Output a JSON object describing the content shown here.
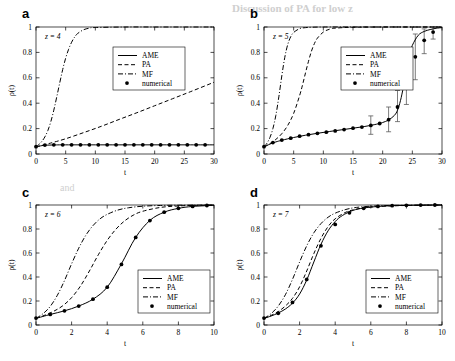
{
  "figure": {
    "background_bleed": [
      {
        "text": "Discussion of PA for low z",
        "x": 232,
        "y": 6
      },
      {
        "text": "and",
        "x": 60,
        "y": 188
      }
    ]
  },
  "common": {
    "xlabel": "t",
    "ylabel": "ρ(t)",
    "ylim": [
      0,
      1
    ],
    "yticks": [
      0,
      0.2,
      0.4,
      0.6,
      0.8,
      1
    ],
    "ytick_labels": [
      "0",
      "0.2",
      "0.4",
      "0.6",
      "0.8",
      "1"
    ],
    "legend_entries": [
      {
        "label": "AME",
        "style": "solid"
      },
      {
        "label": "PA",
        "style": "dashed"
      },
      {
        "label": "MF",
        "style": "dashdot"
      },
      {
        "label": "numerical",
        "style": "marker"
      }
    ],
    "grid": false,
    "legend_position": "inner"
  },
  "chart_data": [
    {
      "type": "line",
      "panel": "a",
      "panel_letter": "a",
      "annotation": "z = 4",
      "title": "",
      "xlabel": "t",
      "ylabel": "ρ(t)",
      "xlim": [
        0,
        30
      ],
      "ylim": [
        0,
        1
      ],
      "xticks": [
        0,
        5,
        10,
        15,
        20,
        25,
        30
      ],
      "xtick_labels": [
        "0",
        "5",
        "10",
        "15",
        "20",
        "25",
        "30"
      ],
      "yticks": [
        0,
        0.2,
        0.4,
        0.6,
        0.8,
        1
      ],
      "series": [
        {
          "name": "AME",
          "style": "solid",
          "x": [
            0,
            1,
            2,
            3,
            4,
            6,
            8,
            10,
            14,
            18,
            22,
            26,
            30
          ],
          "values": [
            0.055,
            0.066,
            0.07,
            0.071,
            0.072,
            0.072,
            0.072,
            0.072,
            0.072,
            0.072,
            0.072,
            0.072,
            0.072
          ]
        },
        {
          "name": "PA",
          "style": "dashed",
          "x": [
            0,
            1,
            2,
            3,
            5,
            8,
            11,
            14,
            17,
            20,
            23,
            26,
            30
          ],
          "values": [
            0.055,
            0.068,
            0.08,
            0.093,
            0.12,
            0.168,
            0.218,
            0.272,
            0.325,
            0.38,
            0.435,
            0.49,
            0.565
          ]
        },
        {
          "name": "MF",
          "style": "dashdot",
          "x": [
            0,
            0.5,
            1,
            1.5,
            2,
            2.5,
            3,
            3.5,
            4,
            4.5,
            5,
            5.5,
            6,
            6.5,
            7,
            8,
            9,
            10,
            15,
            20,
            25,
            30
          ],
          "values": [
            0.055,
            0.075,
            0.1,
            0.135,
            0.185,
            0.255,
            0.345,
            0.45,
            0.56,
            0.665,
            0.755,
            0.825,
            0.88,
            0.92,
            0.948,
            0.978,
            0.991,
            0.996,
            1.0,
            1.0,
            1.0,
            1.0
          ]
        },
        {
          "name": "numerical",
          "style": "marker",
          "x": [
            0,
            1.5,
            3,
            4.5,
            6,
            7.5,
            9,
            10.5,
            12,
            13.5,
            15,
            16.5,
            18,
            19.5,
            21,
            22.5,
            24,
            25.5,
            27,
            28.5
          ],
          "values": [
            0.058,
            0.07,
            0.072,
            0.072,
            0.072,
            0.072,
            0.072,
            0.072,
            0.072,
            0.072,
            0.072,
            0.072,
            0.072,
            0.072,
            0.072,
            0.072,
            0.072,
            0.072,
            0.072,
            0.072
          ]
        }
      ]
    },
    {
      "type": "line",
      "panel": "b",
      "panel_letter": "b",
      "annotation": "z = 5",
      "title": "",
      "xlabel": "t",
      "ylabel": "ρ(t)",
      "xlim": [
        0,
        30
      ],
      "ylim": [
        0,
        1
      ],
      "xticks": [
        0,
        5,
        10,
        15,
        20,
        25,
        30
      ],
      "xtick_labels": [
        "0",
        "5",
        "10",
        "15",
        "20",
        "25",
        "30"
      ],
      "yticks": [
        0,
        0.2,
        0.4,
        0.6,
        0.8,
        1
      ],
      "series": [
        {
          "name": "AME",
          "style": "solid",
          "x": [
            0,
            1,
            2,
            3,
            5,
            7,
            9,
            11,
            13,
            15,
            17,
            19,
            20,
            21,
            22,
            22.5,
            23,
            23.5,
            24,
            24.5,
            25,
            26,
            27,
            28,
            29,
            30
          ],
          "values": [
            0.055,
            0.078,
            0.095,
            0.108,
            0.13,
            0.148,
            0.163,
            0.177,
            0.19,
            0.203,
            0.217,
            0.235,
            0.248,
            0.268,
            0.305,
            0.345,
            0.42,
            0.53,
            0.66,
            0.775,
            0.855,
            0.935,
            0.965,
            0.98,
            0.99,
            0.995
          ]
        },
        {
          "name": "PA",
          "style": "dashed",
          "x": [
            0,
            1,
            2,
            3,
            4,
            5,
            6,
            6.5,
            7,
            7.5,
            8,
            8.5,
            9,
            10,
            11,
            12,
            15,
            20,
            25,
            30
          ],
          "values": [
            0.055,
            0.082,
            0.115,
            0.16,
            0.225,
            0.32,
            0.46,
            0.545,
            0.64,
            0.73,
            0.81,
            0.87,
            0.912,
            0.96,
            0.982,
            0.991,
            0.998,
            1.0,
            1.0,
            1.0
          ]
        },
        {
          "name": "MF",
          "style": "dashdot",
          "x": [
            0,
            0.5,
            1,
            1.5,
            2,
            2.5,
            3,
            3.5,
            4,
            4.5,
            5,
            6,
            7,
            8,
            10,
            15,
            20,
            25,
            30
          ],
          "values": [
            0.055,
            0.085,
            0.13,
            0.2,
            0.305,
            0.45,
            0.615,
            0.76,
            0.862,
            0.923,
            0.957,
            0.987,
            0.995,
            0.998,
            1.0,
            1.0,
            1.0,
            1.0,
            1.0
          ]
        },
        {
          "name": "numerical",
          "style": "marker",
          "x": [
            0,
            1.5,
            3,
            4.5,
            6,
            7.5,
            9,
            10.5,
            12,
            13.5,
            15,
            16.5,
            18,
            19.5,
            21,
            22.5,
            24,
            25.5,
            27,
            28.5
          ],
          "values": [
            0.058,
            0.09,
            0.11,
            0.125,
            0.14,
            0.152,
            0.163,
            0.172,
            0.182,
            0.192,
            0.203,
            0.212,
            0.225,
            0.24,
            0.27,
            0.37,
            0.555,
            0.765,
            0.895,
            0.96
          ]
        }
      ],
      "errorbars": [
        {
          "x": 18,
          "y": 0.225,
          "lower": 0.155,
          "upper": 0.3
        },
        {
          "x": 21,
          "y": 0.27,
          "lower": 0.175,
          "upper": 0.37
        },
        {
          "x": 22.5,
          "y": 0.37,
          "lower": 0.255,
          "upper": 0.5
        },
        {
          "x": 24,
          "y": 0.555,
          "lower": 0.39,
          "upper": 0.72
        },
        {
          "x": 25.5,
          "y": 0.765,
          "lower": 0.585,
          "upper": 0.945
        },
        {
          "x": 27,
          "y": 0.895,
          "lower": 0.79,
          "upper": 0.985
        },
        {
          "x": 28.5,
          "y": 0.96,
          "lower": 0.905,
          "upper": 1.0
        }
      ]
    },
    {
      "type": "line",
      "panel": "c",
      "panel_letter": "c",
      "annotation": "z = 6",
      "title": "",
      "xlabel": "t",
      "ylabel": "ρ(t)",
      "xlim": [
        0,
        10
      ],
      "ylim": [
        0,
        1
      ],
      "xticks": [
        0,
        2,
        4,
        6,
        8,
        10
      ],
      "xtick_labels": [
        "0",
        "2",
        "4",
        "6",
        "8",
        "10"
      ],
      "yticks": [
        0,
        0.2,
        0.4,
        0.6,
        0.8,
        1
      ],
      "series": [
        {
          "name": "AME",
          "style": "solid",
          "x": [
            0,
            0.8,
            1.6,
            2.4,
            3.2,
            4.0,
            4.8,
            5.6,
            6.4,
            7.2,
            8.0,
            8.8,
            10
          ],
          "values": [
            0.055,
            0.088,
            0.118,
            0.158,
            0.215,
            0.315,
            0.51,
            0.73,
            0.872,
            0.94,
            0.972,
            0.988,
            0.997
          ]
        },
        {
          "name": "PA",
          "style": "dashed",
          "x": [
            0,
            0.5,
            1.0,
            1.5,
            2.0,
            2.5,
            3.0,
            3.5,
            4.0,
            4.5,
            5.0,
            5.5,
            6.0,
            7.0,
            8.0,
            9.0,
            10
          ],
          "values": [
            0.055,
            0.082,
            0.115,
            0.16,
            0.228,
            0.325,
            0.45,
            0.585,
            0.705,
            0.8,
            0.87,
            0.918,
            0.948,
            0.98,
            0.992,
            0.997,
            0.999
          ]
        },
        {
          "name": "MF",
          "style": "dashdot",
          "x": [
            0,
            0.4,
            0.8,
            1.2,
            1.6,
            2.0,
            2.4,
            2.8,
            3.2,
            3.6,
            4.0,
            4.6,
            5.2,
            6.0,
            7.0,
            8.0,
            9.0,
            10
          ],
          "values": [
            0.055,
            0.095,
            0.155,
            0.248,
            0.37,
            0.51,
            0.64,
            0.748,
            0.828,
            0.885,
            0.922,
            0.958,
            0.977,
            0.99,
            0.996,
            0.998,
            0.999,
            1.0
          ]
        },
        {
          "name": "numerical",
          "style": "marker",
          "x": [
            0,
            0.8,
            1.6,
            2.4,
            3.2,
            4.0,
            4.8,
            5.6,
            6.4,
            7.2,
            8.0,
            8.8,
            9.6
          ],
          "values": [
            0.058,
            0.088,
            0.118,
            0.158,
            0.215,
            0.315,
            0.505,
            0.73,
            0.87,
            0.94,
            0.972,
            0.988,
            0.996
          ]
        }
      ]
    },
    {
      "type": "line",
      "panel": "d",
      "panel_letter": "d",
      "annotation": "z = 7",
      "title": "",
      "xlabel": "t",
      "ylabel": "ρ(t)",
      "xlim": [
        0,
        10
      ],
      "ylim": [
        0,
        1
      ],
      "xticks": [
        0,
        2,
        4,
        6,
        8,
        10
      ],
      "xtick_labels": [
        "0",
        "2",
        "4",
        "6",
        "8",
        "10"
      ],
      "yticks": [
        0,
        0.2,
        0.4,
        0.6,
        0.8,
        1
      ],
      "series": [
        {
          "name": "AME",
          "style": "solid",
          "x": [
            0,
            0.4,
            0.8,
            1.2,
            1.6,
            2.0,
            2.4,
            2.8,
            3.2,
            3.6,
            4.0,
            4.4,
            5.0,
            5.6,
            6.4,
            7.2,
            8.0,
            9.0,
            10
          ],
          "values": [
            0.055,
            0.075,
            0.1,
            0.133,
            0.182,
            0.258,
            0.375,
            0.525,
            0.672,
            0.785,
            0.862,
            0.912,
            0.955,
            0.975,
            0.988,
            0.994,
            0.997,
            0.999,
            1.0
          ]
        },
        {
          "name": "PA",
          "style": "dashed",
          "x": [
            0,
            0.4,
            0.8,
            1.2,
            1.6,
            2.0,
            2.4,
            2.8,
            3.2,
            3.6,
            4.0,
            4.6,
            5.2,
            6.0,
            7.0,
            8.0,
            9.0,
            10
          ],
          "values": [
            0.055,
            0.08,
            0.112,
            0.158,
            0.222,
            0.318,
            0.45,
            0.595,
            0.722,
            0.82,
            0.885,
            0.94,
            0.966,
            0.983,
            0.992,
            0.996,
            0.998,
            1.0
          ]
        },
        {
          "name": "MF",
          "style": "dashdot",
          "x": [
            0,
            0.4,
            0.8,
            1.2,
            1.6,
            2.0,
            2.4,
            2.8,
            3.2,
            3.6,
            4.0,
            4.6,
            5.2,
            6.0,
            7.0,
            8.0,
            9.0,
            10
          ],
          "values": [
            0.055,
            0.095,
            0.158,
            0.252,
            0.38,
            0.525,
            0.66,
            0.768,
            0.845,
            0.898,
            0.932,
            0.963,
            0.98,
            0.99,
            0.996,
            0.998,
            0.999,
            1.0
          ]
        },
        {
          "name": "numerical",
          "style": "marker",
          "x": [
            0,
            0.8,
            1.6,
            2.4,
            3.2,
            4.0,
            4.8,
            5.6,
            6.4,
            7.2,
            8.0,
            8.8,
            9.6
          ],
          "values": [
            0.058,
            0.098,
            0.188,
            0.38,
            0.66,
            0.838,
            0.935,
            0.972,
            0.988,
            0.994,
            0.997,
            0.999,
            1.0
          ]
        }
      ]
    }
  ]
}
